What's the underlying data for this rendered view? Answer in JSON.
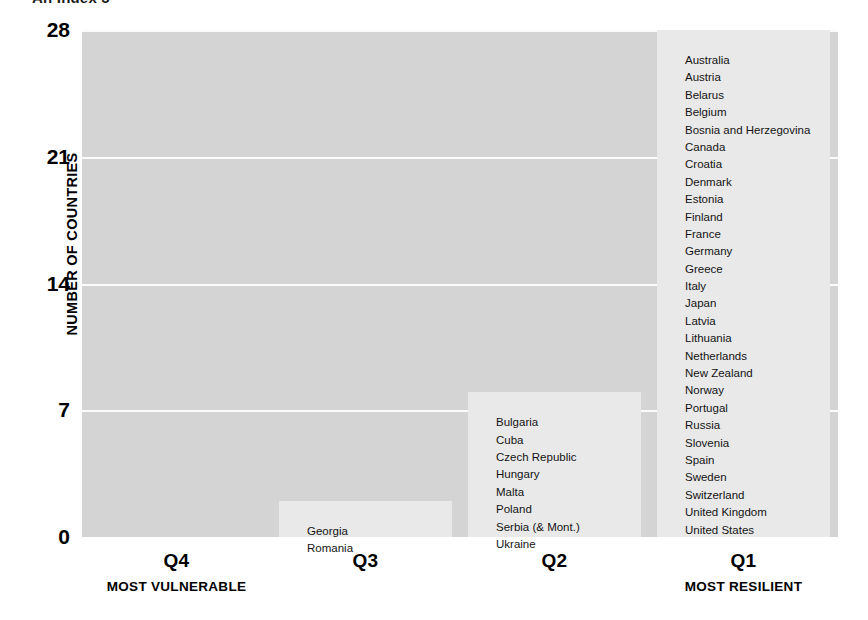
{
  "title_fragment": "An Index 5",
  "chart_data": {
    "type": "bar",
    "title": "",
    "xlabel": "",
    "ylabel": "NUMBER OF COUNTRIES",
    "ylim": [
      0,
      28
    ],
    "yticks": [
      "0",
      "7",
      "14",
      "21",
      "28"
    ],
    "ytick_values": [
      0,
      7,
      14,
      21,
      28
    ],
    "grid": true,
    "legend": "none",
    "categories": [
      "Q4",
      "Q3",
      "Q2",
      "Q1"
    ],
    "values": [
      0,
      2,
      8,
      28
    ],
    "category_sublabels": [
      "MOST VULNERABLE",
      "",
      "",
      "MOST RESILIENT"
    ],
    "bar_item_labels": [
      [],
      [
        "Georgia",
        "Romania"
      ],
      [
        "Bulgaria",
        "Cuba",
        "Czech Republic",
        "Hungary",
        "Malta",
        "Poland",
        "Serbia (& Mont.)",
        "Ukraine"
      ],
      [
        "Australia",
        "Austria",
        "Belarus",
        "Belgium",
        "Bosnia and Herzegovina",
        "Canada",
        "Croatia",
        "Denmark",
        "Estonia",
        "Finland",
        "France",
        "Germany",
        "Greece",
        "Italy",
        "Japan",
        "Latvia",
        "Lithuania",
        "Netherlands",
        "New Zealand",
        "Norway",
        "Portugal",
        "Russia",
        "Slovenia",
        "Spain",
        "Sweden",
        "Switzerland",
        "United Kingdom",
        "United States"
      ]
    ],
    "colors": {
      "plot_background": "#d4d4d4",
      "bar_fill": "#e9e9e9",
      "gridline": "#fbfbfb",
      "text": "#000000",
      "page_background": "#ffffff"
    }
  }
}
